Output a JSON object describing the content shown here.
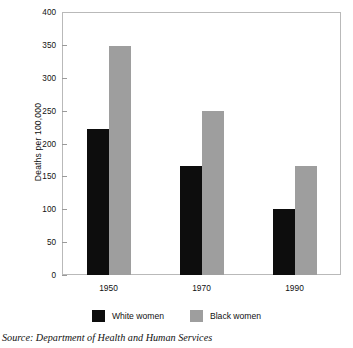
{
  "chart_data": {
    "type": "bar",
    "title": "",
    "xlabel": "",
    "ylabel": "Deaths per 100,000",
    "categories": [
      "1950",
      "1970",
      "1990"
    ],
    "series": [
      {
        "name": "White women",
        "color": "#0d0d0d",
        "values": [
          222,
          166,
          100
        ]
      },
      {
        "name": "Black women",
        "color": "#9e9e9e",
        "values": [
          349,
          250,
          166
        ]
      }
    ],
    "ylim": [
      0,
      400
    ],
    "ytick_values": [
      0,
      50,
      100,
      150,
      200,
      250,
      300,
      350,
      400
    ],
    "ytick_labels": [
      "0",
      "50",
      "100",
      "150",
      "200",
      "250",
      "300",
      "350",
      "400"
    ],
    "grid": false,
    "legend_position": "bottom-center",
    "annotations": [
      "Source: Department of Health and Human Services"
    ]
  },
  "figure": {
    "source_note": "Source: Department of Health and Human Services"
  },
  "legend": {
    "items": [
      {
        "label": "White women"
      },
      {
        "label": "Black women"
      }
    ]
  },
  "colors": {
    "series_white_women": "#0d0d0d",
    "series_black_women": "#9e9e9e",
    "frame": "#b9b9b9",
    "text": "#111111",
    "background": "#ffffff"
  }
}
